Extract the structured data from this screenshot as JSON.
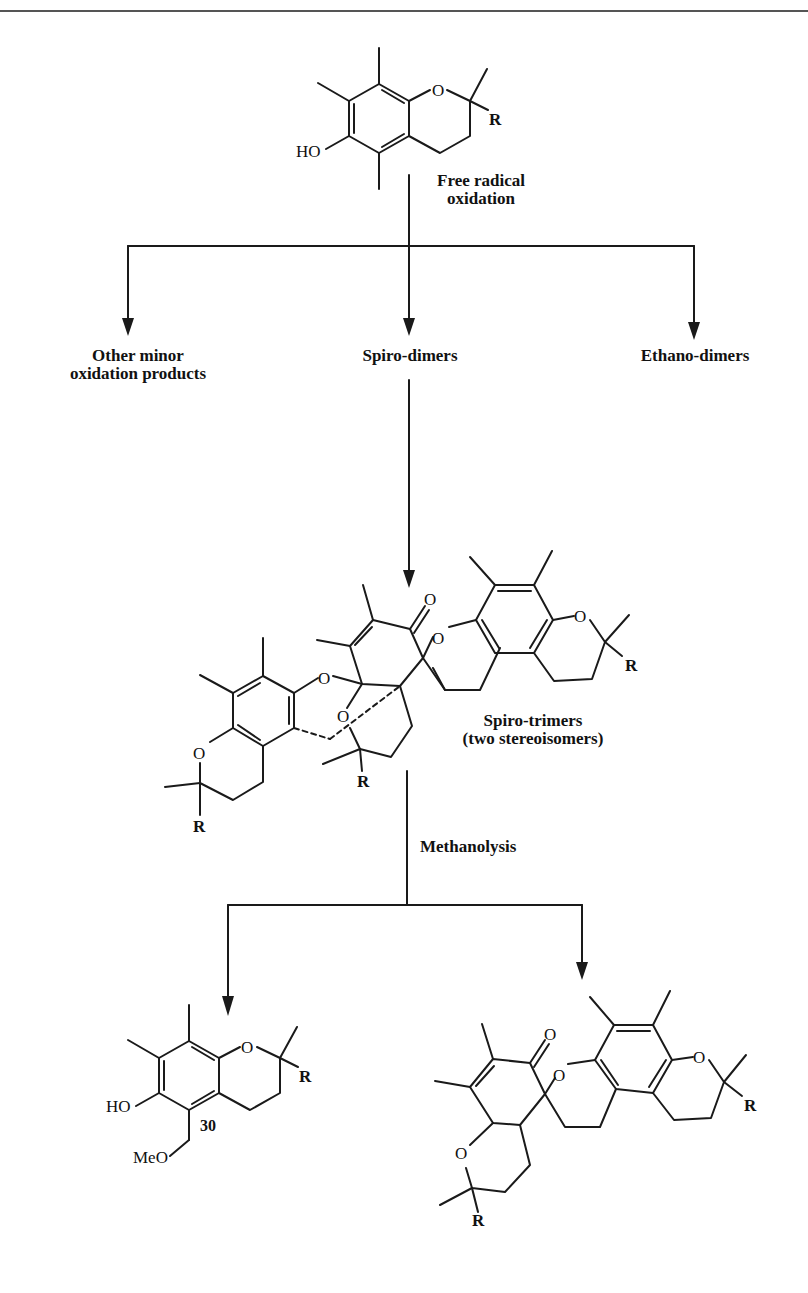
{
  "header_rule": {
    "color": "#555555"
  },
  "starting_material": {
    "name": "tocopherol (chromanol core)",
    "atoms": {
      "ring_O": "O",
      "substituent": "R",
      "hydroxyl": "HO"
    }
  },
  "step1": {
    "label_line1": "Free  radical",
    "label_line2": "oxidation"
  },
  "products_level1": [
    {
      "line1": "Other minor",
      "line2": "oxidation  products"
    },
    {
      "line1": "Spiro-dimers"
    },
    {
      "line1": "Ethano-dimers"
    }
  ],
  "spiro_trimer": {
    "label_line1": "Spiro-trimers",
    "label_line2": "(two stereoisomers)",
    "atoms": {
      "carbonyl_O": "O",
      "O": "O",
      "R": "R"
    }
  },
  "step2": {
    "label": "Methanolysis"
  },
  "product_30": {
    "number": "30",
    "atoms": {
      "ring_O": "O",
      "R": "R",
      "hydroxyl": "HO",
      "methoxy": "MeO"
    }
  },
  "product_dimer": {
    "atoms": {
      "carbonyl_O": "O",
      "O": "O",
      "R": "R"
    }
  }
}
